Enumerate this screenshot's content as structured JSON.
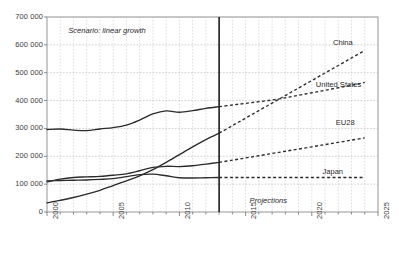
{
  "chart_data": {
    "type": "line",
    "title": "",
    "xlabel": "",
    "ylabel": "",
    "xlim": [
      2000,
      2025
    ],
    "ylim": [
      0,
      700000
    ],
    "grid": true,
    "legend_position": "inline-right-labels",
    "y_ticks": [
      "0",
      "100 000",
      "200 000",
      "300 000",
      "400 000",
      "500 000",
      "600 000",
      "700 000"
    ],
    "y_tick_values": [
      0,
      100000,
      200000,
      300000,
      400000,
      500000,
      600000,
      700000
    ],
    "x_ticks": [
      "2000",
      "2005",
      "2010",
      "2015",
      "2020",
      "2025"
    ],
    "x_tick_values": [
      2000,
      2005,
      2010,
      2015,
      2020,
      2025
    ],
    "annotations": [
      {
        "name": "scenario-note",
        "text": "Scenario: linear growth",
        "x": 2001.6,
        "y": 648000,
        "style": "italic"
      },
      {
        "name": "projections-note",
        "text": "Projections",
        "x": 2015.3,
        "y": 38000,
        "style": "italic"
      }
    ],
    "divider": {
      "name": "history-projection-divider",
      "x": 2013,
      "label": "",
      "style": "solid-vertical"
    },
    "history_range": [
      2000,
      2013
    ],
    "projection_range": [
      2013,
      2024
    ],
    "series": [
      {
        "name": "China",
        "label": "China",
        "color": "#2b2b2b",
        "label_x": 2021.6,
        "label_y": 607000,
        "x": [
          2000,
          2001,
          2002,
          2003,
          2004,
          2005,
          2006,
          2007,
          2008,
          2009,
          2010,
          2011,
          2012,
          2013,
          2014,
          2015,
          2016,
          2017,
          2018,
          2019,
          2020,
          2021,
          2022,
          2023,
          2024
        ],
        "values": [
          33000,
          42000,
          52000,
          64000,
          78000,
          95000,
          112000,
          130000,
          152000,
          178000,
          206000,
          234000,
          260000,
          283000,
          310000,
          337000,
          364000,
          391000,
          418000,
          445000,
          472000,
          499000,
          526000,
          553000,
          580000
        ]
      },
      {
        "name": "United States",
        "label": "United States",
        "color": "#2b2b2b",
        "label_x": 2020.3,
        "label_y": 455000,
        "x": [
          2000,
          2001,
          2002,
          2003,
          2004,
          2005,
          2006,
          2007,
          2008,
          2009,
          2010,
          2011,
          2012,
          2013,
          2014,
          2015,
          2016,
          2017,
          2018,
          2019,
          2020,
          2021,
          2022,
          2023,
          2024
        ],
        "values": [
          296000,
          298000,
          294000,
          292000,
          298000,
          303000,
          312000,
          330000,
          352000,
          363000,
          358000,
          364000,
          372000,
          378000,
          384000,
          390000,
          396000,
          402000,
          410000,
          419000,
          428000,
          437000,
          446000,
          455000,
          465000
        ]
      },
      {
        "name": "EU28",
        "label": "EU28",
        "color": "#2b2b2b",
        "label_x": 2021.8,
        "label_y": 318000,
        "x": [
          2000,
          2001,
          2002,
          2003,
          2004,
          2005,
          2006,
          2007,
          2008,
          2009,
          2010,
          2011,
          2012,
          2013,
          2014,
          2015,
          2016,
          2017,
          2018,
          2019,
          2020,
          2021,
          2022,
          2023,
          2024
        ],
        "values": [
          108000,
          118000,
          124000,
          126000,
          128000,
          132000,
          137000,
          148000,
          160000,
          164000,
          163000,
          166000,
          172000,
          178000,
          186000,
          194000,
          202000,
          210000,
          218000,
          226000,
          234000,
          242000,
          250000,
          258000,
          266000
        ]
      },
      {
        "name": "Japan",
        "label": "Japan",
        "color": "#2b2b2b",
        "label_x": 2020.8,
        "label_y": 142000,
        "x": [
          2000,
          2001,
          2002,
          2003,
          2004,
          2005,
          2006,
          2007,
          2008,
          2009,
          2010,
          2011,
          2012,
          2013,
          2014,
          2015,
          2016,
          2017,
          2018,
          2019,
          2020,
          2021,
          2022,
          2023,
          2024
        ],
        "values": [
          112000,
          113000,
          114000,
          115000,
          117000,
          120000,
          127000,
          134000,
          136000,
          130000,
          123000,
          122000,
          123000,
          124000,
          124000,
          124000,
          124000,
          124000,
          124000,
          124000,
          124000,
          124000,
          124000,
          124000,
          124000
        ]
      }
    ]
  }
}
